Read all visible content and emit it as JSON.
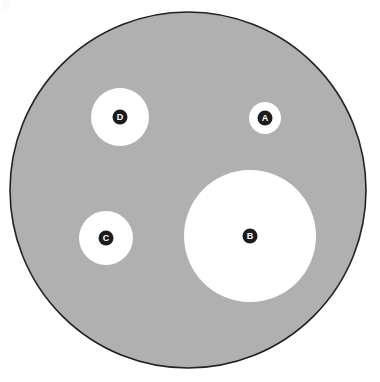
{
  "figure": {
    "type": "nested-circle-diagram",
    "canvas": {
      "width": 380,
      "height": 382,
      "background": "#ffffff"
    },
    "corner_mark": "|||",
    "outer_circle": {
      "name": "outer-boundary-circle",
      "cx": 188,
      "cy": 190,
      "r": 178,
      "fill": "#b0b0b0",
      "stroke": "#222222",
      "stroke_width": 1.6
    },
    "inner_circles": [
      {
        "label": "A",
        "name": "inner-circle-a",
        "cx": 265,
        "cy": 118,
        "r": 16,
        "fill": "#ffffff",
        "badge_r": 7.5,
        "badge_fill": "#1c1c1c",
        "label_size": 9
      },
      {
        "label": "B",
        "name": "inner-circle-b",
        "cx": 250,
        "cy": 236,
        "r": 66,
        "fill": "#ffffff",
        "badge_r": 7.5,
        "badge_fill": "#1c1c1c",
        "label_size": 9
      },
      {
        "label": "C",
        "name": "inner-circle-c",
        "cx": 106,
        "cy": 238,
        "r": 27,
        "fill": "#ffffff",
        "badge_r": 7.5,
        "badge_fill": "#1c1c1c",
        "label_size": 9
      },
      {
        "label": "D",
        "name": "inner-circle-d",
        "cx": 120,
        "cy": 117,
        "r": 29,
        "fill": "#ffffff",
        "badge_r": 7.5,
        "badge_fill": "#1c1c1c",
        "label_size": 9
      }
    ]
  },
  "chart_data": {
    "type": "scatter",
    "title": "",
    "xlabel": "",
    "ylabel": "",
    "legend": [],
    "grid": false,
    "xlim": [
      0,
      380
    ],
    "ylim": [
      0,
      382
    ],
    "categories": [
      "A",
      "B",
      "C",
      "D"
    ],
    "values": [
      16,
      66,
      27,
      29
    ],
    "series": [
      {
        "name": "inner circle radius (px)",
        "values": [
          16,
          66,
          27,
          29
        ]
      },
      {
        "name": "center x (px)",
        "values": [
          265,
          250,
          106,
          120
        ]
      },
      {
        "name": "center y (px)",
        "values": [
          118,
          236,
          238,
          117
        ]
      }
    ],
    "annotations": [
      {
        "text": "A",
        "x": 265,
        "y": 118
      },
      {
        "text": "B",
        "x": 250,
        "y": 236
      },
      {
        "text": "C",
        "x": 106,
        "y": 238
      },
      {
        "text": "D",
        "x": 120,
        "y": 117
      }
    ]
  }
}
